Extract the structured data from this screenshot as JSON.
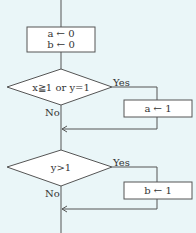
{
  "flowchart": {
    "colors": {
      "background": "#eaf6f8",
      "line": "#555555",
      "text": "#333333",
      "box_fill": "#ffffff"
    },
    "nodes": {
      "init": {
        "type": "process",
        "line1": "a ← 0",
        "line2": "b ← 0"
      },
      "decision1": {
        "type": "decision",
        "condition": "x≧1 or y=1",
        "yes_label": "Yes",
        "no_label": "No"
      },
      "assign_a": {
        "type": "process",
        "text": "a ← 1"
      },
      "decision2": {
        "type": "decision",
        "condition": "y>1",
        "yes_label": "Yes",
        "no_label": "No"
      },
      "assign_b": {
        "type": "process",
        "text": "b ← 1"
      }
    }
  }
}
